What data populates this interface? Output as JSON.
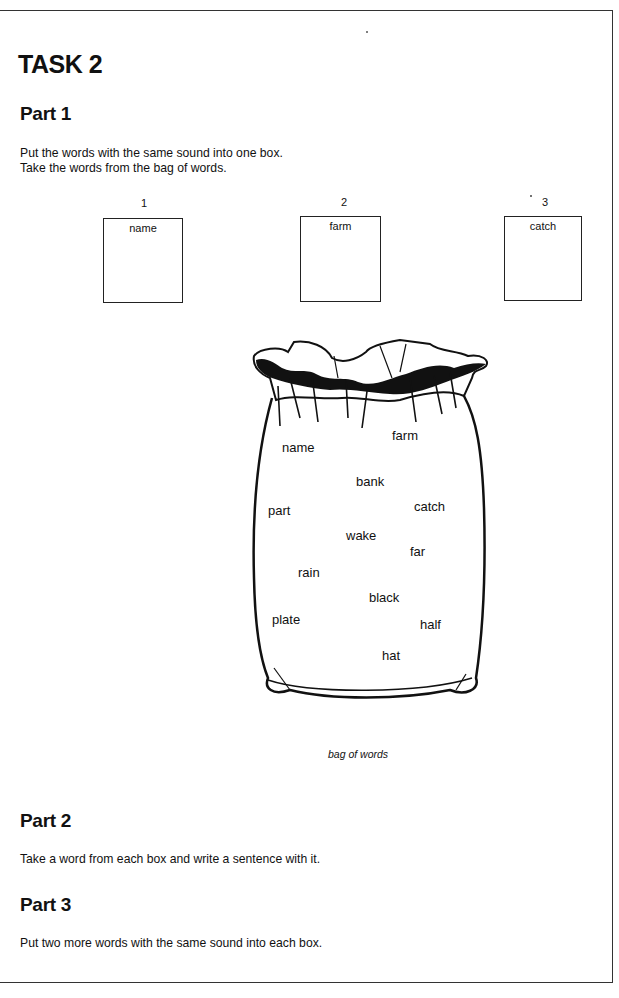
{
  "page": {
    "title": "TASK 2",
    "parts": [
      {
        "heading": "Part 1",
        "instructions": [
          "Put the words with the same sound into one box.",
          "Take the words from the bag of words."
        ]
      },
      {
        "heading": "Part 2",
        "instructions": [
          "Take a word from each box and write a sentence with it."
        ]
      },
      {
        "heading": "Part 3",
        "instructions": [
          "Put two more words with the same sound into each box."
        ]
      }
    ],
    "boxes": [
      {
        "number": "1",
        "word": "name"
      },
      {
        "number": "2",
        "word": "farm"
      },
      {
        "number": "3",
        "word": "catch"
      }
    ],
    "bag": {
      "caption": "bag of words",
      "words": [
        "name",
        "farm",
        "bank",
        "part",
        "catch",
        "wake",
        "far",
        "rain",
        "black",
        "plate",
        "half",
        "hat"
      ]
    }
  }
}
